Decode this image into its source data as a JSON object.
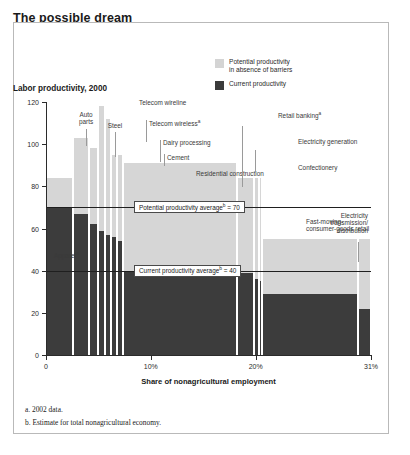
{
  "header": {
    "title": "The possible dream",
    "subtitle": "Index: labor productivity for best-practice country in each sector = 100"
  },
  "legend": {
    "potential_label": "Potential productivity in absence of barriers",
    "potential_line1": "Potential productivity",
    "potential_line2": "in absence of barriers",
    "current_label": "Current productivity",
    "potential_color": "#d6d6d6",
    "current_color": "#3c3c3c"
  },
  "notes": [
    "a. 2002 data.",
    "b. Estimate for total nonagricultural economy."
  ],
  "chart_data": {
    "type": "bar",
    "title": "Labor productivity, 2000",
    "xlabel": "Share of nonagricultural employment",
    "ylabel": "",
    "ylim": [
      0,
      120
    ],
    "yticks": [
      0,
      20,
      40,
      60,
      80,
      100,
      120
    ],
    "ytick_labels": [
      "0",
      "20",
      "40",
      "60",
      "80",
      "100",
      "120"
    ],
    "xlim": [
      0,
      31
    ],
    "xticks": [
      0,
      10,
      20,
      31
    ],
    "xtick_labels": [
      "0",
      "10%",
      "20%",
      "31%"
    ],
    "grid": false,
    "legend_position": "top-right",
    "stacked": true,
    "width_units": "percent_of_nonagricultural_employment",
    "reference_lines": [
      {
        "name": "potential-productivity-average",
        "label": "Potential productivity averageᵇ = 70",
        "label_plain": "Potential productivity average",
        "sup": "b",
        "value": 70
      },
      {
        "name": "current-productivity-average",
        "label": "Current productivity averageᵇ = 40",
        "label_plain": "Current productivity average",
        "sup": "b",
        "value": 40
      }
    ],
    "series": [
      {
        "name": "Potential productivity in absence of barriers",
        "color": "#d6d6d6"
      },
      {
        "name": "Current productivity",
        "color": "#3c3c3c"
      }
    ],
    "sectors": [
      {
        "label": "Apparel",
        "sup": "a",
        "x_start": 0.0,
        "x_end": 2.6,
        "potential": 84,
        "current": 70
      },
      {
        "label": "Auto parts",
        "sup": "",
        "x_start": 2.6,
        "x_end": 4.1,
        "potential": 103,
        "current": 67
      },
      {
        "label": "Steel",
        "sup": "",
        "x_start": 4.1,
        "x_end": 5.0,
        "potential": 98,
        "current": 62
      },
      {
        "label": "Telecom wireline",
        "sup": "",
        "x_start": 5.0,
        "x_end": 5.6,
        "potential": 118,
        "current": 59
      },
      {
        "label": "Telecom wireless",
        "sup": "a",
        "x_start": 5.6,
        "x_end": 6.2,
        "potential": 112,
        "current": 57
      },
      {
        "label": "Dairy processing",
        "sup": "",
        "x_start": 6.2,
        "x_end": 6.8,
        "potential": 95,
        "current": 56
      },
      {
        "label": "Cement",
        "sup": "",
        "x_start": 6.8,
        "x_end": 7.3,
        "potential": 95,
        "current": 54
      },
      {
        "label": "Residential construction",
        "sup": "",
        "x_start": 7.3,
        "x_end": 18.2,
        "potential": 91,
        "current": 40
      },
      {
        "label": "Retail banking",
        "sup": "a",
        "x_start": 18.2,
        "x_end": 19.8,
        "potential": 84,
        "current": 39
      },
      {
        "label": "Electricity generation",
        "sup": "",
        "x_start": 19.8,
        "x_end": 20.3,
        "potential": 84,
        "current": 36
      },
      {
        "label": "Confectionery",
        "sup": "",
        "x_start": 20.3,
        "x_end": 20.6,
        "potential": 84,
        "current": 35
      },
      {
        "label": "Fast-moving-consumer-goods retail",
        "sup": "",
        "x_start": 20.6,
        "x_end": 29.8,
        "potential": 55,
        "current": 29
      },
      {
        "label": "Electricity transmission/distribution",
        "sup": "",
        "x_start": 29.8,
        "x_end": 31.0,
        "potential": 55,
        "current": 22
      }
    ]
  }
}
